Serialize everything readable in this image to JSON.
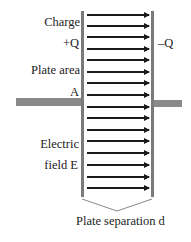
{
  "diagram": {
    "labels": {
      "charge": "Charge",
      "plus_q": "+Q",
      "minus_q": "–Q",
      "plate_area": "Plate area",
      "area_symbol": "A",
      "electric": "Electric",
      "field_e": "field E",
      "separation": "Plate separation d"
    },
    "colors": {
      "plate": "#7a7a7a",
      "wire": "#8a8a8a",
      "arrow": "#1a1a1a",
      "text": "#222222",
      "bracket": "#888888"
    },
    "field_lines": {
      "count": 16,
      "y_positions": [
        15,
        26,
        37,
        49,
        60,
        72,
        83,
        95,
        107,
        118,
        130,
        141,
        153,
        165,
        177,
        188
      ]
    }
  }
}
